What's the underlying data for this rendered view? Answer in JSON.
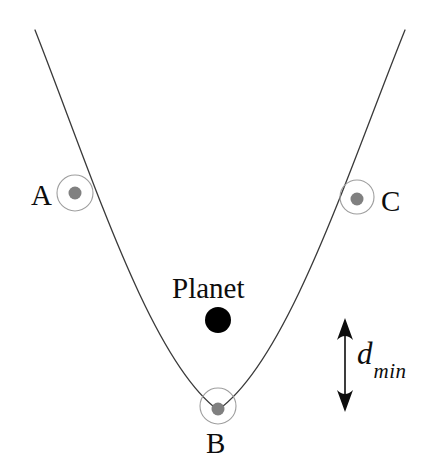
{
  "figure": {
    "type": "orbital-trajectory-diagram",
    "background_color": "#ffffff",
    "curve": {
      "name": "flyby-trajectory",
      "stroke_color": "#3a3a3a",
      "stroke_width": 1.3,
      "path": "M 35 30 C 92 175, 150 360, 218 410 C 288 360, 348 172, 405 30"
    },
    "planet": {
      "label": "Planet",
      "color": "#000000",
      "cx": 218,
      "cy": 320,
      "r": 13
    },
    "markers": [
      {
        "label": "A",
        "cx": 75,
        "cy": 193,
        "ring_r": 18,
        "dot_r": 6.5,
        "ring_color": "#9e9e9e",
        "dot_color": "#808080"
      },
      {
        "label": "B",
        "cx": 218,
        "cy": 406,
        "ring_r": 18,
        "dot_r": 6.5,
        "ring_color": "#9e9e9e",
        "dot_color": "#808080"
      },
      {
        "label": "C",
        "cx": 357,
        "cy": 197,
        "ring_r": 17,
        "dot_r": 6.5,
        "ring_color": "#9e9e9e",
        "dot_color": "#808080"
      }
    ],
    "annotation": {
      "symbol": "d",
      "subscript": "min",
      "arrow": {
        "name": "d-min-double-arrow",
        "x": 345,
        "y_top": 320,
        "y_bottom": 410,
        "color": "#0d0d0d",
        "shaft_width": 1.6,
        "head_half_width": 8,
        "head_length": 20
      }
    }
  }
}
